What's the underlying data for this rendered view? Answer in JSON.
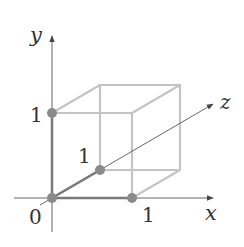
{
  "diagram": {
    "axes": [
      {
        "name": "x",
        "label": "x"
      },
      {
        "name": "y",
        "label": "y"
      },
      {
        "name": "z",
        "label": "z"
      }
    ],
    "tick_labels": {
      "origin": "0",
      "x_one": "1",
      "y_one": "1",
      "z_one": "1"
    },
    "points": [
      {
        "name": "origin",
        "coords": [
          0,
          0,
          0
        ]
      },
      {
        "name": "x-unit",
        "coords": [
          1,
          0,
          0
        ]
      },
      {
        "name": "y-unit",
        "coords": [
          0,
          1,
          0
        ]
      },
      {
        "name": "z-unit",
        "coords": [
          0,
          0,
          1
        ]
      }
    ],
    "colors": {
      "axis": "#666666",
      "cube_edge": "#c4c4c4",
      "unit_edge": "#777777",
      "point": "#8a8a8a",
      "text": "#333333"
    }
  }
}
